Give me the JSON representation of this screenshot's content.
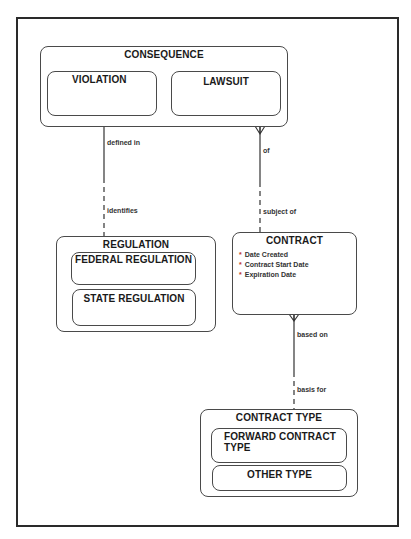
{
  "diagram": {
    "type": "entity-relationship",
    "entities": [
      {
        "id": "consequence",
        "label": "CONSEQUENCE",
        "subtypes": [
          {
            "label": "VIOLATION"
          },
          {
            "label": "LAWSUIT"
          }
        ]
      },
      {
        "id": "regulation",
        "label": "REGULATION",
        "subtypes": [
          {
            "label": "FEDERAL REGULATION"
          },
          {
            "label": "STATE REGULATION"
          }
        ]
      },
      {
        "id": "contract",
        "label": "CONTRACT",
        "attributes": [
          {
            "marker": "*",
            "name": "Date Created"
          },
          {
            "marker": "*",
            "name": "Contract Start Date"
          },
          {
            "marker": "*",
            "name": "Expiration Date"
          }
        ]
      },
      {
        "id": "contract_type",
        "label": "CONTRACT TYPE",
        "subtypes": [
          {
            "label": "FORWARD CONTRACT TYPE"
          },
          {
            "label": "OTHER TYPE"
          }
        ]
      }
    ],
    "relationships": [
      {
        "from": "VIOLATION",
        "to": "REGULATION",
        "from_label": "defined in",
        "to_label": "identifies"
      },
      {
        "from": "CONSEQUENCE",
        "to": "CONTRACT",
        "from_label": "of",
        "to_label": "subject of"
      },
      {
        "from": "CONTRACT",
        "to": "CONTRACT TYPE",
        "from_label": "based on",
        "to_label": "basis for"
      }
    ]
  },
  "colors": {
    "frame": "#2a2a2a",
    "entity_border": "#4a4a4a",
    "attribute_marker": "#c0392b",
    "text": "#1a1a1a"
  }
}
